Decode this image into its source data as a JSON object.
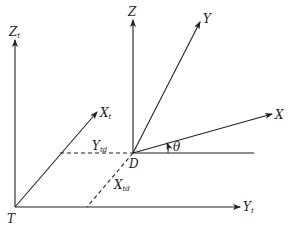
{
  "diagram": {
    "type": "coordinate-frames",
    "colors": {
      "line": "#222222",
      "background": "#ffffff"
    },
    "frames": {
      "target": {
        "origin_label": "T",
        "axes": [
          {
            "name": "Z",
            "sub": "t"
          },
          {
            "name": "X",
            "sub": "t"
          },
          {
            "name": "Y",
            "sub": "t"
          }
        ]
      },
      "device": {
        "origin_label": "D",
        "axes": [
          {
            "name": "Z",
            "sub": ""
          },
          {
            "name": "Y",
            "sub": ""
          },
          {
            "name": "X",
            "sub": ""
          }
        ]
      }
    },
    "offsets": [
      {
        "name": "Y",
        "sub": "td",
        "style": "dashed"
      },
      {
        "name": "X",
        "sub": "td",
        "style": "dashed"
      }
    ],
    "angle": {
      "label": "θ"
    }
  }
}
